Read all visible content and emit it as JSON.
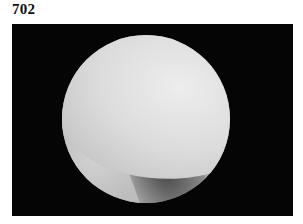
{
  "figure": {
    "label": "702",
    "image_description": "arthroscopic view: circular endoscope field on black background showing pale cartilage surface over darker tissue"
  },
  "colors": {
    "background": "#ffffff",
    "frame": "#050505",
    "tissue_light": "#e6e6e6",
    "tissue_dark": "#3a3a3a"
  }
}
